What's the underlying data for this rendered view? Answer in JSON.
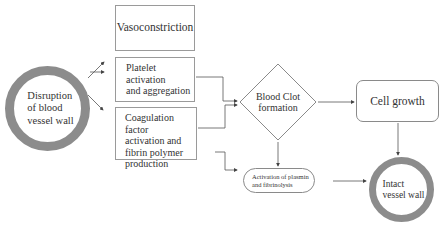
{
  "diagram": {
    "nodes": {
      "disruption": {
        "label": "Disruption of blood vessel wall",
        "lines": [
          "Disruption",
          "of blood",
          "vessel wall"
        ],
        "shape": "ring"
      },
      "vasoconstriction": {
        "label": "Vasoconstriction",
        "shape": "rectangle"
      },
      "platelet": {
        "label": "Platelet activation and aggregation",
        "lines": [
          "Platelet activation",
          "and aggregation"
        ],
        "shape": "rectangle"
      },
      "coagulation": {
        "label": "Coagulation factor activation and fibrin polymer production",
        "lines": [
          "Coagulation factor",
          "activation and",
          "fibrin polymer",
          "production"
        ],
        "shape": "rectangle"
      },
      "clot": {
        "label": "Blood Clot formation",
        "lines": [
          "Blood Clot",
          "formation"
        ],
        "shape": "diamond"
      },
      "cell_growth": {
        "label": "Cell growth",
        "shape": "rounded-rectangle"
      },
      "plasmin": {
        "label": "Activation of plasmin and fibrinolysis",
        "lines": [
          "Activation of plasmin",
          "and fibrinolysis"
        ],
        "shape": "stadium"
      },
      "intact": {
        "label": "Intact vessel wall",
        "lines": [
          "Intact",
          "vessel wall"
        ],
        "shape": "ring"
      }
    },
    "edges": [
      {
        "from": "disruption",
        "to": "vasoconstriction"
      },
      {
        "from": "disruption",
        "to": "platelet"
      },
      {
        "from": "disruption",
        "to": "coagulation"
      },
      {
        "from": "platelet",
        "to": "clot"
      },
      {
        "from": "coagulation",
        "to": "clot"
      },
      {
        "from": "coagulation",
        "to": "plasmin"
      },
      {
        "from": "clot",
        "to": "cell_growth"
      },
      {
        "from": "clot",
        "to": "plasmin"
      },
      {
        "from": "cell_growth",
        "to": "intact"
      },
      {
        "from": "plasmin",
        "to": "intact"
      }
    ],
    "colors": {
      "ring": "#8c8c8c",
      "border": "#9a9a9a",
      "line": "#555555",
      "text": "#333333"
    }
  }
}
